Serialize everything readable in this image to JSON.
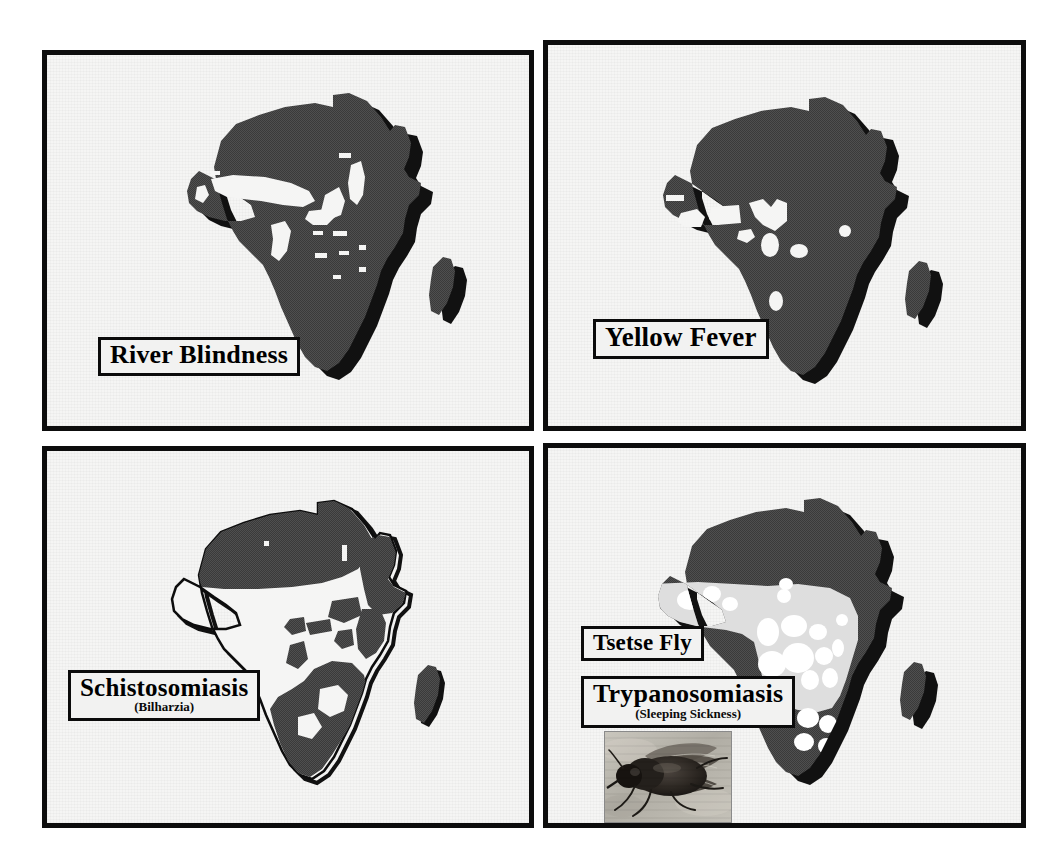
{
  "figure": {
    "kind": "four-panel map plate",
    "background_color": "#ffffff",
    "panel_background_color": "#f5f5f4",
    "panel_border_color": "#0d0d0d",
    "affected_area_color": "#4a4a4a",
    "tsetse_band_color": "#d9d9d9",
    "unaffected_area_color": "#f5f5f4"
  },
  "panels": [
    {
      "id": "river-blindness",
      "position": "top-left",
      "caption": {
        "main": "River Blindness",
        "sub": ""
      },
      "map": {
        "name": "africa",
        "shading": "dark",
        "note": "dark fill over most of the continent with small white inclusions in the Sahel, Congo basin and Lake Victoria region"
      }
    },
    {
      "id": "yellow-fever",
      "position": "top-right",
      "caption": {
        "main": "Yellow Fever",
        "sub": ""
      },
      "map": {
        "name": "africa",
        "shading": "dark",
        "note": "dark fill over nearly the whole continent with a few small white patches in West Africa and the Gulf of Guinea"
      }
    },
    {
      "id": "schistosomiasis",
      "position": "bottom-left",
      "caption": {
        "main": "Schistosomiasis",
        "sub": "(Bilharzia)"
      },
      "map": {
        "name": "africa",
        "shading": "dark-patches-on-outline",
        "note": "dark patches across the Sahara/Sahel belt, the Nile valley, East Africa and southern Africa; West and Central Africa left white inside a drawn outline"
      }
    },
    {
      "id": "trypanosomiasis",
      "position": "bottom-right",
      "captions": [
        {
          "main": "Tsetse Fly",
          "sub": ""
        },
        {
          "main": "Trypanosomiasis",
          "sub": "(Sleeping Sickness)"
        }
      ],
      "map": {
        "name": "africa",
        "shading": "light-band",
        "note": "a light grey band with white blotches spanning the continent between roughly 14N and 20S marks the tsetse fly belt; the rest of the continent is dark"
      },
      "inset": {
        "name": "tsetse-fly-photograph",
        "caption": "",
        "description": "close-up black and white photograph of a tsetse fly resting on a pale surface"
      }
    }
  ]
}
